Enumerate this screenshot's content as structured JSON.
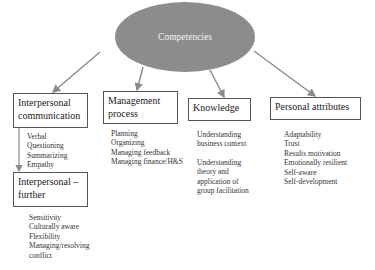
{
  "root": {
    "label": "Competencies",
    "fill": "#8c8c8c"
  },
  "categories": [
    {
      "id": "interpersonal",
      "title_line1": "Interpersonal",
      "title_line2": "communication",
      "items": [
        "Verbal",
        "Questioning",
        "Summarizing",
        "Empathy"
      ]
    },
    {
      "id": "management",
      "title_line1": "Management",
      "title_line2": "process",
      "items": [
        "Planning",
        "Organizing",
        "Managing feedback",
        "Managing finance/H&S"
      ]
    },
    {
      "id": "knowledge",
      "title_line1": "Knowledge",
      "items": [
        "Understanding",
        "business context",
        "",
        "Understanding",
        "theory and",
        "application of",
        "group facilitation"
      ]
    },
    {
      "id": "personal",
      "title_line1": "Personal attributes",
      "items": [
        "Adaptability",
        "Trust",
        "Results motivation",
        "Emotionally resilient",
        "Self-aware",
        "Self-development"
      ]
    }
  ],
  "further": {
    "title_line1": "Interpersonal –",
    "title_line2": "further",
    "items": [
      "Sensitivity",
      "Culturally aware",
      "Flexibility",
      "Managing/resolving",
      "conflict"
    ]
  },
  "colors": {
    "line": "#8a8a8a",
    "border": "#555555"
  }
}
